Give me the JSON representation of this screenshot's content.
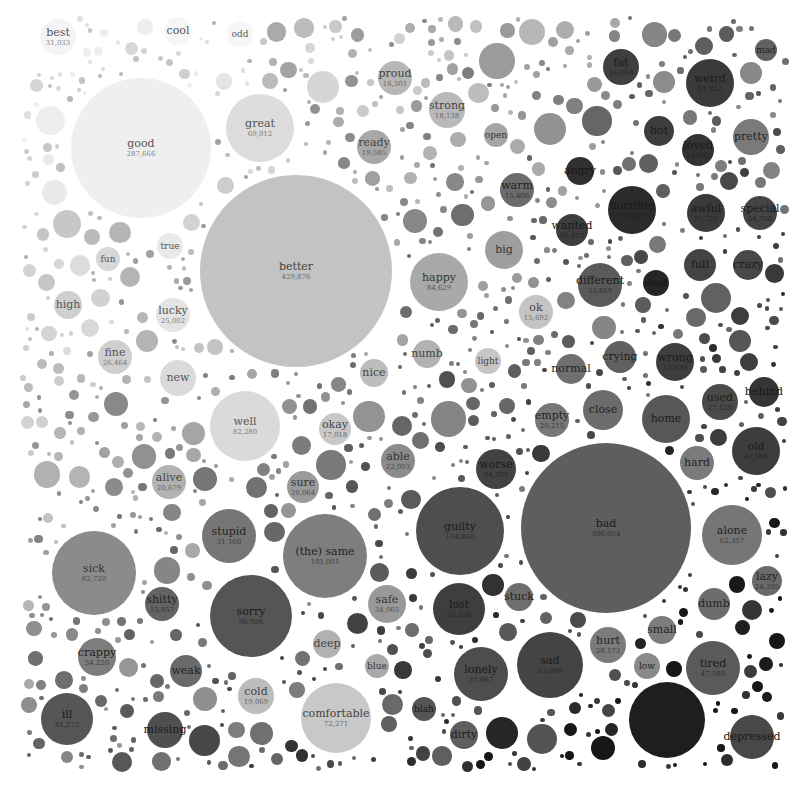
{
  "chart_data": {
    "type": "bubble",
    "title": "",
    "legend": [],
    "bubbles": [
      {
        "word": "best",
        "value": 31033,
        "x": 58,
        "y": 37,
        "r": 18,
        "color": "#f4f4f4",
        "text": "#555555"
      },
      {
        "word": "cool",
        "value": null,
        "x": 178,
        "y": 31,
        "r": 14,
        "color": "#f6f6f6",
        "text": "#555555"
      },
      {
        "word": "odd",
        "value": null,
        "x": 240,
        "y": 34,
        "r": 13,
        "color": "#f6f6f6",
        "text": "#555555"
      },
      {
        "word": "good",
        "value": 287666,
        "x": 141,
        "y": 148,
        "r": 70,
        "color": "#efefef",
        "text": "#555555"
      },
      {
        "word": "great",
        "value": 69012,
        "x": 260,
        "y": 128,
        "r": 34,
        "color": "#dcdcdc",
        "text": "#555555"
      },
      {
        "word": "proud",
        "value": 16501,
        "x": 395,
        "y": 78,
        "r": 17,
        "color": "#b7b7b7",
        "text": "#444444"
      },
      {
        "word": "strong",
        "value": 18138,
        "x": 447,
        "y": 110,
        "r": 18,
        "color": "#b9b9b9",
        "text": "#444444"
      },
      {
        "word": "ready",
        "value": 19585,
        "x": 374,
        "y": 147,
        "r": 17,
        "color": "#a8a8a8",
        "text": "#444444"
      },
      {
        "word": "open",
        "value": null,
        "x": 496,
        "y": 135,
        "r": 12,
        "color": "#a5a5a5",
        "text": "#333333"
      },
      {
        "word": "warm",
        "value": 15406,
        "x": 517,
        "y": 190,
        "r": 17,
        "color": "#6c6c6c",
        "text": "#222222"
      },
      {
        "word": "big",
        "value": null,
        "x": 504,
        "y": 250,
        "r": 19,
        "color": "#9e9e9e",
        "text": "#333333"
      },
      {
        "word": "happy",
        "value": 84629,
        "x": 439,
        "y": 282,
        "r": 29,
        "color": "#a9a9a9",
        "text": "#333333"
      },
      {
        "word": "ok",
        "value": 15692,
        "x": 536,
        "y": 312,
        "r": 17,
        "color": "#c4c4c4",
        "text": "#444444"
      },
      {
        "word": "better",
        "value": 429876,
        "x": 296,
        "y": 271,
        "r": 96,
        "color": "#c3c3c3",
        "text": "#444444"
      },
      {
        "word": "true",
        "value": null,
        "x": 170,
        "y": 246,
        "r": 13,
        "color": "#e9e9e9",
        "text": "#555555"
      },
      {
        "word": "fun",
        "value": null,
        "x": 108,
        "y": 259,
        "r": 12,
        "color": "#d7d7d7",
        "text": "#555555"
      },
      {
        "word": "high",
        "value": null,
        "x": 68,
        "y": 305,
        "r": 14,
        "color": "#cfcfcf",
        "text": "#555555"
      },
      {
        "word": "lucky",
        "value": 25002,
        "x": 173,
        "y": 315,
        "r": 17,
        "color": "#e4e4e4",
        "text": "#555555"
      },
      {
        "word": "fine",
        "value": 26464,
        "x": 115,
        "y": 357,
        "r": 17,
        "color": "#cfcfcf",
        "text": "#555555"
      },
      {
        "word": "new",
        "value": null,
        "x": 178,
        "y": 378,
        "r": 18,
        "color": "#dadada",
        "text": "#555555"
      },
      {
        "word": "nice",
        "value": null,
        "x": 374,
        "y": 373,
        "r": 14,
        "color": "#bdbdbd",
        "text": "#444444"
      },
      {
        "word": "numb",
        "value": null,
        "x": 427,
        "y": 354,
        "r": 14,
        "color": "#b2b2b2",
        "text": "#444444"
      },
      {
        "word": "light",
        "value": null,
        "x": 488,
        "y": 361,
        "r": 13,
        "color": "#c6c6c6",
        "text": "#444444"
      },
      {
        "word": "normal",
        "value": null,
        "x": 571,
        "y": 369,
        "r": 15,
        "color": "#6f6f6f",
        "text": "#222222"
      },
      {
        "word": "well",
        "value": 82280,
        "x": 245,
        "y": 426,
        "r": 35,
        "color": "#dadada",
        "text": "#555555"
      },
      {
        "word": "okay",
        "value": 17018,
        "x": 335,
        "y": 429,
        "r": 16,
        "color": "#c8c8c8",
        "text": "#444444"
      },
      {
        "word": "empty",
        "value": 20215,
        "x": 552,
        "y": 420,
        "r": 17,
        "color": "#787878",
        "text": "#222222"
      },
      {
        "word": "close",
        "value": null,
        "x": 603,
        "y": 410,
        "r": 20,
        "color": "#6c6c6c",
        "text": "#222222"
      },
      {
        "word": "crying",
        "value": null,
        "x": 620,
        "y": 357,
        "r": 16,
        "color": "#606060",
        "text": "#222222"
      },
      {
        "word": "wrong",
        "value": 37835,
        "x": 675,
        "y": 362,
        "r": 19,
        "color": "#3e3e3e",
        "text": "#1a1a1a"
      },
      {
        "word": "home",
        "value": null,
        "x": 666,
        "y": 419,
        "r": 24,
        "color": "#575757",
        "text": "#1a1a1a"
      },
      {
        "word": "used",
        "value": 27120,
        "x": 720,
        "y": 402,
        "r": 18,
        "color": "#4a4a4a",
        "text": "#1a1a1a"
      },
      {
        "word": "behind",
        "value": null,
        "x": 764,
        "y": 392,
        "r": 15,
        "color": "#353535",
        "text": "#1a1a1a"
      },
      {
        "word": "old",
        "value": 47086,
        "x": 756,
        "y": 451,
        "r": 24,
        "color": "#3d3d3d",
        "text": "#1a1a1a"
      },
      {
        "word": "hard",
        "value": null,
        "x": 697,
        "y": 463,
        "r": 17,
        "color": "#7b7b7b",
        "text": "#222222"
      },
      {
        "word": "worse",
        "value": 34737,
        "x": 496,
        "y": 469,
        "r": 20,
        "color": "#424242",
        "text": "#1a1a1a"
      },
      {
        "word": "able",
        "value": 22093,
        "x": 398,
        "y": 461,
        "r": 17,
        "color": "#8b8b8b",
        "text": "#333333"
      },
      {
        "word": "sure",
        "value": 20064,
        "x": 303,
        "y": 487,
        "r": 16,
        "color": "#9a9a9a",
        "text": "#333333"
      },
      {
        "word": "alive",
        "value": 20679,
        "x": 169,
        "y": 482,
        "r": 17,
        "color": "#b2b2b2",
        "text": "#444444"
      },
      {
        "word": "stupid",
        "value": 31160,
        "x": 229,
        "y": 536,
        "r": 27,
        "color": "#767676",
        "text": "#222222"
      },
      {
        "word": "(the) same",
        "value": 101001,
        "x": 325,
        "y": 556,
        "r": 42,
        "color": "#7e7e7e",
        "text": "#222222"
      },
      {
        "word": "guilty",
        "value": 134850,
        "x": 460,
        "y": 531,
        "r": 44,
        "color": "#4e4e4e",
        "text": "#1a1a1a"
      },
      {
        "word": "bad",
        "value": 306054,
        "x": 606,
        "y": 528,
        "r": 85,
        "color": "#5e5e5e",
        "text": "#1a1a1a"
      },
      {
        "word": "alone",
        "value": 62357,
        "x": 732,
        "y": 535,
        "r": 30,
        "color": "#767676",
        "text": "#222222"
      },
      {
        "word": "lazy",
        "value": 24295,
        "x": 767,
        "y": 581,
        "r": 15,
        "color": "#6a6a6a",
        "text": "#222222"
      },
      {
        "word": "dumb",
        "value": null,
        "x": 714,
        "y": 604,
        "r": 16,
        "color": "#6d6d6d",
        "text": "#222222"
      },
      {
        "word": "small",
        "value": null,
        "x": 662,
        "y": 630,
        "r": 14,
        "color": "#7d7d7d",
        "text": "#222222"
      },
      {
        "word": "sick",
        "value": 82720,
        "x": 94,
        "y": 573,
        "r": 42,
        "color": "#8b8b8b",
        "text": "#333333"
      },
      {
        "word": "shitty",
        "value": 15657,
        "x": 162,
        "y": 604,
        "r": 17,
        "color": "#636363",
        "text": "#222222"
      },
      {
        "word": "sorry",
        "value": 96926,
        "x": 251,
        "y": 616,
        "r": 41,
        "color": "#555555",
        "text": "#1a1a1a"
      },
      {
        "word": "safe",
        "value": 34065,
        "x": 387,
        "y": 604,
        "r": 19,
        "color": "#999999",
        "text": "#333333"
      },
      {
        "word": "stuck",
        "value": null,
        "x": 519,
        "y": 597,
        "r": 14,
        "color": "#6e6e6e",
        "text": "#222222"
      },
      {
        "word": "lost",
        "value": 55158,
        "x": 459,
        "y": 609,
        "r": 26,
        "color": "#3e3e3e",
        "text": "#1a1a1a"
      },
      {
        "word": "crappy",
        "value": 34220,
        "x": 97,
        "y": 657,
        "r": 19,
        "color": "#7d7d7d",
        "text": "#222222"
      },
      {
        "word": "weak",
        "value": null,
        "x": 186,
        "y": 671,
        "r": 16,
        "color": "#6a6a6a",
        "text": "#222222"
      },
      {
        "word": "deep",
        "value": null,
        "x": 327,
        "y": 644,
        "r": 14,
        "color": "#b1b1b1",
        "text": "#444444"
      },
      {
        "word": "blue",
        "value": null,
        "x": 377,
        "y": 666,
        "r": 12,
        "color": "#a9a9a9",
        "text": "#333333"
      },
      {
        "word": "hurt",
        "value": 28173,
        "x": 608,
        "y": 645,
        "r": 18,
        "color": "#7b7b7b",
        "text": "#222222"
      },
      {
        "word": "low",
        "value": null,
        "x": 647,
        "y": 666,
        "r": 13,
        "color": "#8a8a8a",
        "text": "#222222"
      },
      {
        "word": "tired",
        "value": 47585,
        "x": 713,
        "y": 668,
        "r": 27,
        "color": "#5a5a5a",
        "text": "#1a1a1a"
      },
      {
        "word": "sad",
        "value": 63096,
        "x": 550,
        "y": 665,
        "r": 33,
        "color": "#444444",
        "text": "#1a1a1a"
      },
      {
        "word": "lonely",
        "value": 37667,
        "x": 481,
        "y": 674,
        "r": 27,
        "color": "#4d4d4d",
        "text": "#1a1a1a"
      },
      {
        "word": "cold",
        "value": 19069,
        "x": 256,
        "y": 696,
        "r": 18,
        "color": "#bcbcbc",
        "text": "#444444"
      },
      {
        "word": "comfortable",
        "value": 72271,
        "x": 336,
        "y": 718,
        "r": 35,
        "color": "#c8c8c8",
        "text": "#444444"
      },
      {
        "word": "blah",
        "value": null,
        "x": 424,
        "y": 709,
        "r": 12,
        "color": "#555555",
        "text": "#1a1a1a"
      },
      {
        "word": "dirty",
        "value": null,
        "x": 464,
        "y": 735,
        "r": 14,
        "color": "#5f5f5f",
        "text": "#1a1a1a"
      },
      {
        "word": "ill",
        "value": 41272,
        "x": 67,
        "y": 719,
        "r": 26,
        "color": "#565656",
        "text": "#1a1a1a"
      },
      {
        "word": "missing",
        "value": null,
        "x": 165,
        "y": 730,
        "r": 18,
        "color": "#4f4f4f",
        "text": "#1a1a1a"
      },
      {
        "word": "",
        "value": null,
        "x": 667,
        "y": 720,
        "r": 38,
        "color": "#1e1e1e",
        "text": "#111111"
      },
      {
        "word": "depressed",
        "value": null,
        "x": 752,
        "y": 737,
        "r": 22,
        "color": "#484848",
        "text": "#1a1a1a"
      },
      {
        "word": "fat",
        "value": 16618,
        "x": 621,
        "y": 67,
        "r": 18,
        "color": "#3f3f3f",
        "text": "#1a1a1a"
      },
      {
        "word": "weird",
        "value": 51832,
        "x": 710,
        "y": 83,
        "r": 24,
        "color": "#3a3a3a",
        "text": "#1a1a1a"
      },
      {
        "word": "mad",
        "value": null,
        "x": 766,
        "y": 50,
        "r": 11,
        "color": "#616161",
        "text": "#222222"
      },
      {
        "word": "hot",
        "value": null,
        "x": 659,
        "y": 131,
        "r": 15,
        "color": "#3d3d3d",
        "text": "#1a1a1a"
      },
      {
        "word": "loved",
        "value": 24967,
        "x": 698,
        "y": 150,
        "r": 16,
        "color": "#333333",
        "text": "#1a1a1a"
      },
      {
        "word": "pretty",
        "value": null,
        "x": 751,
        "y": 137,
        "r": 18,
        "color": "#7a7a7a",
        "text": "#222222"
      },
      {
        "word": "angry",
        "value": null,
        "x": 580,
        "y": 171,
        "r": 14,
        "color": "#2f2f2f",
        "text": "#1a1a1a"
      },
      {
        "word": "horrible",
        "value": 36585,
        "x": 632,
        "y": 210,
        "r": 24,
        "color": "#2b2b2b",
        "text": "#1a1a1a"
      },
      {
        "word": "wanted",
        "value": 26873,
        "x": 572,
        "y": 230,
        "r": 16,
        "color": "#3e3e3e",
        "text": "#1a1a1a"
      },
      {
        "word": "awful",
        "value": 25725,
        "x": 706,
        "y": 213,
        "r": 19,
        "color": "#3a3a3a",
        "text": "#1a1a1a"
      },
      {
        "word": "special",
        "value": 24750,
        "x": 760,
        "y": 213,
        "r": 17,
        "color": "#444444",
        "text": "#1a1a1a"
      },
      {
        "word": "full",
        "value": null,
        "x": 700,
        "y": 265,
        "r": 16,
        "color": "#444444",
        "text": "#1a1a1a"
      },
      {
        "word": "crazy",
        "value": null,
        "x": 748,
        "y": 265,
        "r": 15,
        "color": "#484848",
        "text": "#1a1a1a"
      },
      {
        "word": "different",
        "value": 33669,
        "x": 600,
        "y": 285,
        "r": 22,
        "color": "#5a5a5a",
        "text": "#1a1a1a"
      },
      {
        "word": "dead",
        "value": null,
        "x": 656,
        "y": 283,
        "r": 13,
        "color": "#262626",
        "text": "#111111"
      }
    ]
  }
}
